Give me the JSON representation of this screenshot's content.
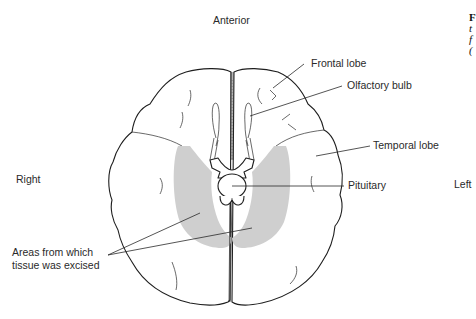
{
  "diagram": {
    "orientation": {
      "top": "Anterior",
      "left_side": "Right",
      "right_side": "Left"
    },
    "labels": {
      "frontal_lobe": "Frontal lobe",
      "olfactory_bulb": "Olfactory bulb",
      "temporal_lobe": "Temporal lobe",
      "pituitary": "Pituitary",
      "excised_line1": "Areas from which",
      "excised_line2": "tissue was excised"
    },
    "shade_color": "#cfcfcf",
    "caption_fragment": [
      "F",
      "t",
      "f",
      "("
    ]
  }
}
